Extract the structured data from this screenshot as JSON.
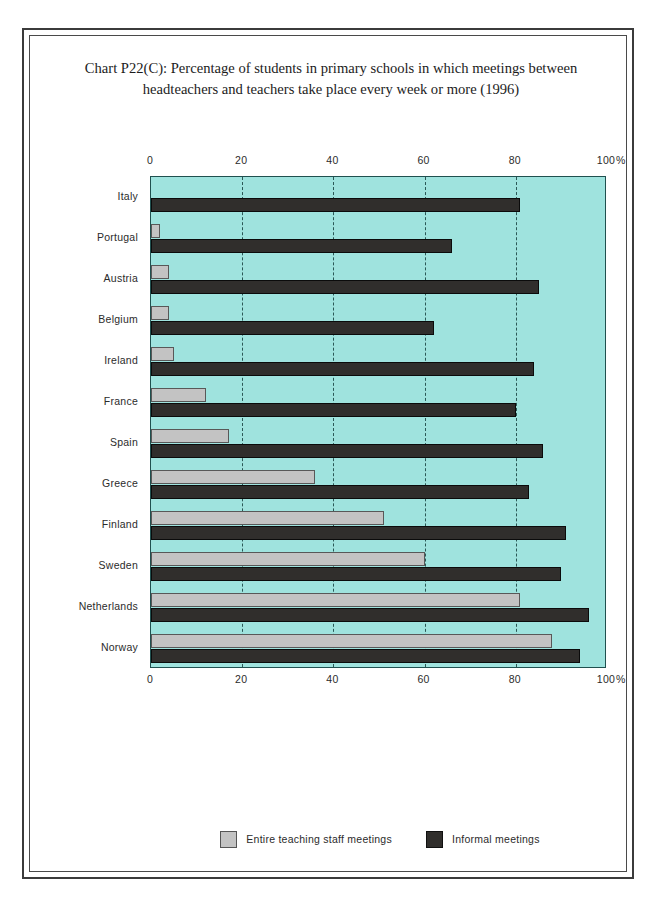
{
  "title": {
    "line1": "Chart P22(C): Percentage of students in primary schools in which meetings between",
    "line2": "headteachers and teachers take place every week or more (1996)"
  },
  "legend": {
    "entire_label": "Entire teaching staff meetings",
    "informal_label": "Informal meetings",
    "entire_color": "#c3c3c3",
    "informal_color": "#302e2c"
  },
  "colors": {
    "plot_background": "#9fe3de",
    "frame": "#3b3b3b",
    "text": "#2b2b2b"
  },
  "axis": {
    "unit": "%",
    "ticks": [
      0,
      20,
      40,
      60,
      80,
      100
    ]
  },
  "chart_data": {
    "type": "bar",
    "orientation": "horizontal",
    "title": "Chart P22(C): Percentage of students in primary schools in which meetings between headteachers and teachers take place every week or more (1996)",
    "xlabel": "%",
    "ylabel": "",
    "xlim": [
      0,
      100
    ],
    "tick_labels": [
      "0",
      "20",
      "40",
      "60",
      "80",
      "100"
    ],
    "grid": true,
    "legend_position": "bottom",
    "categories": [
      "Italy",
      "Portugal",
      "Austria",
      "Belgium",
      "Ireland",
      "France",
      "Spain",
      "Greece",
      "Finland",
      "Sweden",
      "Netherlands",
      "Norway"
    ],
    "series": [
      {
        "name": "Entire teaching staff meetings",
        "color": "#c3c3c3",
        "values": [
          0,
          2,
          4,
          4,
          5,
          12,
          17,
          36,
          51,
          60,
          81,
          88
        ]
      },
      {
        "name": "Informal meetings",
        "color": "#302e2c",
        "values": [
          81,
          66,
          85,
          62,
          84,
          80,
          86,
          83,
          91,
          90,
          96,
          94
        ]
      }
    ]
  }
}
